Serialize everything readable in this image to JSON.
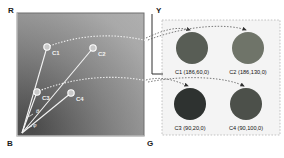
{
  "figure": {
    "left_panel": {
      "name": "rgb-chromaticity-plane",
      "axis_top_left_label": "R",
      "axis_bottom_left_label": "B",
      "axis_bottom_right_label": "G",
      "points": [
        {
          "id": "c1",
          "label": "C1",
          "x": 47,
          "y": 47
        },
        {
          "id": "c2",
          "label": "C2",
          "x": 93,
          "y": 48
        },
        {
          "id": "c3",
          "label": "C3",
          "x": 37,
          "y": 92
        },
        {
          "id": "c4",
          "label": "C4",
          "x": 71,
          "y": 93
        }
      ],
      "angle_labels": [
        {
          "id": "theta",
          "label": "θ",
          "x": 38,
          "y": 112
        },
        {
          "id": "phi",
          "label": "φ",
          "x": 35,
          "y": 126
        }
      ]
    },
    "right_panel": {
      "name": "color-swatch-legend",
      "axis_label": "Y",
      "swatches": [
        {
          "id": "c1",
          "caption": "C1 (186,60,0)",
          "color": "#585d55",
          "cx": 192,
          "cy": 48,
          "r": 16
        },
        {
          "id": "c2",
          "caption": "C2 (186,130,0)",
          "color": "#6f7469",
          "cx": 248,
          "cy": 48,
          "r": 16
        },
        {
          "id": "c3",
          "caption": "C3 (90,20,0)",
          "color": "#2e3230",
          "cx": 190,
          "cy": 104,
          "r": 16
        },
        {
          "id": "c4",
          "caption": "C4 (90,100,0)",
          "color": "#4c504a",
          "cx": 246,
          "cy": 104,
          "r": 16
        }
      ]
    }
  },
  "colors": {
    "panel_border": "#6f6f6f",
    "legend_border": "#9a9a9a",
    "ray": "#f0f0f0",
    "arrow": "#3a3a3a"
  }
}
